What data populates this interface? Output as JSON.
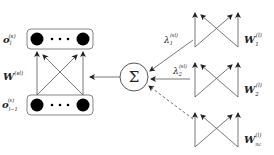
{
  "diagram": {
    "left_group": {
      "top_layer_label": {
        "base": "o",
        "sub": "l",
        "sup": "(s)"
      },
      "bottom_layer_label": {
        "base": "o",
        "sub": "l−1",
        "sup": "(s)"
      },
      "weight_label": {
        "base": "W",
        "sup": "(sl)"
      },
      "ellipsis": "• • •"
    },
    "sum_node": {
      "symbol": "Σ"
    },
    "right_group": {
      "blocks": [
        {
          "weight": {
            "base": "W",
            "sub": "1",
            "sup": "(l)"
          },
          "coeff": {
            "base": "λ",
            "sub": "1",
            "sup": "(sl)"
          },
          "connection": "solid"
        },
        {
          "weight": {
            "base": "W",
            "sub": "2",
            "sup": "(l)"
          },
          "coeff": {
            "base": "λ",
            "sub": "2",
            "sup": "(sl)"
          },
          "connection": "solid"
        },
        {
          "weight": {
            "base": "W",
            "sub": "nc",
            "sup": "(l)"
          },
          "coeff": null,
          "connection": "dashed"
        }
      ]
    },
    "colors": {
      "stroke": "#555555",
      "node_fill": "#000000",
      "text": "#222222"
    }
  }
}
